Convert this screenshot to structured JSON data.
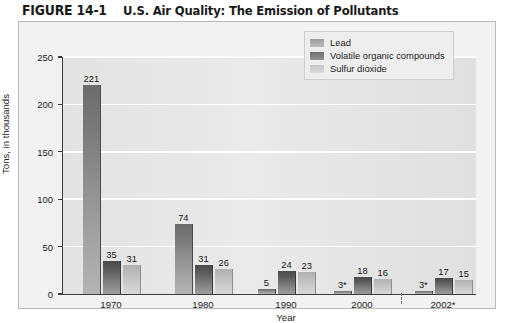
{
  "figure": {
    "number": "FIGURE 14-1",
    "title": "U.S. Air Quality: The Emission of Pollutants"
  },
  "chart_data": {
    "type": "bar",
    "title": "U.S. Air Quality: The Emission of Pollutants",
    "xlabel": "Year",
    "ylabel": "Tons, in thousands",
    "ylim": [
      0,
      250
    ],
    "ytick_labels": [
      "0",
      "50",
      "100",
      "150",
      "200",
      "250"
    ],
    "ytick_values": [
      0,
      50,
      100,
      150,
      200,
      250
    ],
    "grid": true,
    "legend_position": "top-right",
    "axis_break_after_category": "2000",
    "categories": [
      "1970",
      "1980",
      "1990",
      "2000",
      "2002*"
    ],
    "series": [
      {
        "name": "Lead",
        "color": "#8a8a8a",
        "values": [
          221,
          74,
          5,
          3,
          3
        ],
        "labels": [
          "221",
          "74",
          "5",
          "3*",
          "3*"
        ]
      },
      {
        "name": "Volatile organic compounds",
        "color": "#5e5e5e",
        "values": [
          35,
          31,
          24,
          18,
          17
        ],
        "labels": [
          "35",
          "31",
          "24",
          "18",
          "17"
        ]
      },
      {
        "name": "Sulfur dioxide",
        "color": "#c6c6c6",
        "values": [
          31,
          26,
          23,
          16,
          15
        ],
        "labels": [
          "31",
          "26",
          "23",
          "16",
          "15"
        ]
      }
    ]
  },
  "legend": {
    "items": [
      {
        "label": "Lead"
      },
      {
        "label": "Volatile organic compounds"
      },
      {
        "label": "Sulfur dioxide"
      }
    ]
  }
}
